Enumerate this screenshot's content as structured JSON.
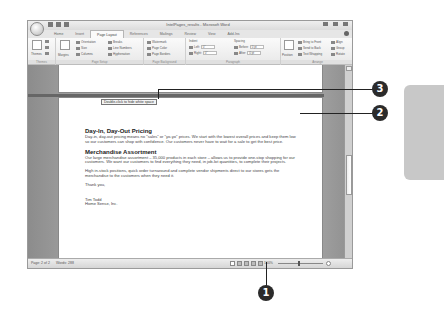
{
  "window": {
    "title": "IntelPages_results - Microsoft Word",
    "tabs": [
      {
        "label": "Home",
        "active": false
      },
      {
        "label": "Insert",
        "active": false
      },
      {
        "label": "Page Layout",
        "active": true
      },
      {
        "label": "References",
        "active": false
      },
      {
        "label": "Mailings",
        "active": false
      },
      {
        "label": "Review",
        "active": false
      },
      {
        "label": "View",
        "active": false
      },
      {
        "label": "Add-Ins",
        "active": false
      }
    ]
  },
  "ribbon": {
    "themes": {
      "label": "Themes",
      "group": "Themes"
    },
    "page_setup": {
      "group": "Page Setup",
      "margins": "Margins",
      "orientation": "Orientation",
      "size": "Size",
      "columns": "Columns",
      "breaks": "Breaks",
      "line_numbers": "Line Numbers",
      "hyphenation": "Hyphenation"
    },
    "page_background": {
      "group": "Page Background",
      "watermark": "Watermark",
      "page_color": "Page Color",
      "page_borders": "Page Borders"
    },
    "paragraph": {
      "group": "Paragraph",
      "indent_label": "Indent",
      "indent_left_label": "Left:",
      "indent_left_value": "0\"",
      "indent_right_label": "Right:",
      "indent_right_value": "0\"",
      "spacing_label": "Spacing",
      "spacing_before_label": "Before:",
      "spacing_before_value": "0 pt",
      "spacing_after_label": "After:",
      "spacing_after_value": "0 pt"
    },
    "arrange": {
      "group": "Arrange",
      "position": "Position",
      "bring_to_front": "Bring to Front",
      "send_to_back": "Send to Back",
      "text_wrapping": "Text Wrapping",
      "align": "Align",
      "group_btn": "Group",
      "rotate": "Rotate"
    }
  },
  "document": {
    "tooltip": "Double-click to hide white space",
    "sections": [
      {
        "heading": "Day-In, Day-Out Pricing",
        "body": "Day-in, day-out pricing means no \"sales\" or \"yo-yo\" prices. We start with the lowest overall prices and keep them low so our customers can shop with confidence. Our customers never have to wait for a sale to get the best price."
      },
      {
        "heading": "Merchandise Assortment",
        "body": "Our large merchandise assortment – 35,000 products in each store – allows us to provide one-stop shopping for our customers. We want our customers to find everything they need, in job-lot quantities, to complete their projects."
      }
    ],
    "paragraph3": "High in-stock positions, quick order turnaround and complete vendor shipments direct to our stores gets the merchandise to the customers when they need it.",
    "closing": "Thank you,",
    "signature_name": "Tim Todd",
    "signature_company": "Home Sense, Inc."
  },
  "statusbar": {
    "page": "Page: 2 of 2",
    "words": "Words: 288",
    "zoom": "100%"
  },
  "callouts": [
    {
      "number": "1",
      "target": "print-layout-view-button"
    },
    {
      "number": "2",
      "target": "page-gap"
    },
    {
      "number": "3",
      "target": "tooltip"
    }
  ]
}
